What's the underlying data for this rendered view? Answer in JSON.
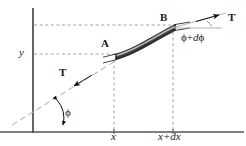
{
  "figure": {
    "type": "physics-diagram",
    "width": 246,
    "height": 146,
    "background_color": "#ffffff",
    "axes": {
      "x_axis": {
        "name": "x-axis",
        "y": 132,
        "x_start": 0,
        "x_end": 244,
        "color": "#555555"
      },
      "y_axis": {
        "name": "y-axis",
        "x": 33,
        "y_start": 8,
        "y_end": 133,
        "color": "#555555"
      }
    },
    "labels": {
      "tension_upper": "T",
      "tension_lower": "T",
      "point_a": "A",
      "point_b": "B",
      "y_value": "y",
      "x_value": "x",
      "x_plus_dx": "x+dx",
      "angle_phi": "ϕ",
      "angle_phi_plus_dphi": "ϕ + dϕ",
      "angle_phi_plus_dphi_parts": {
        "phi": "ϕ",
        "plus": "+",
        "d": "d",
        "phi2": "ϕ"
      }
    },
    "colors": {
      "band_dark": "#3b3b3b",
      "band_mid": "#5a5a5a",
      "band_highlight": "#c9c9c9",
      "band_outline": "#1a1a1a",
      "dashed": "#9a9a9a",
      "axis": "#555555",
      "tangent": "#b4b4b4",
      "text": "#1a1a1a"
    },
    "guides": {
      "dashed_horizontal_upper_y": 25,
      "dashed_horizontal_lower_y": 54,
      "dashed_vertical_left_x": 114,
      "dashed_vertical_right_x": 173
    },
    "element": {
      "point_a_coords": [
        116,
        56
      ],
      "point_b_coords": [
        175,
        27
      ],
      "description": "shaded curved band between A and B"
    }
  }
}
